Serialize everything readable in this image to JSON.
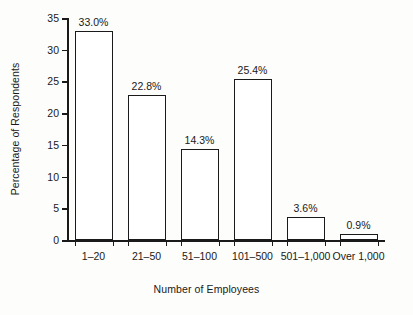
{
  "chart_data": {
    "type": "bar",
    "title": "",
    "xlabel": "Number of Employees",
    "ylabel": "Percentage of Respondents",
    "categories": [
      "1–20",
      "21–50",
      "51–100",
      "101–500",
      "501–1,000",
      "Over 1,000"
    ],
    "values": [
      33.0,
      22.8,
      14.3,
      25.4,
      3.6,
      0.9
    ],
    "value_labels": [
      "33.0%",
      "22.8%",
      "14.3%",
      "25.4%",
      "3.6%",
      "0.9%"
    ],
    "ylim": [
      0,
      35
    ],
    "ytick_values": [
      0,
      5,
      10,
      15,
      20,
      25,
      30,
      35
    ],
    "ytick_labels": [
      "0",
      "5",
      "10",
      "15",
      "20",
      "25",
      "30",
      "35"
    ],
    "grid": false,
    "legend": null,
    "bar_fill_color": "#ffffff",
    "bar_edge_color": "#1a1a1a",
    "axis_color": "#1a1a1a",
    "background_color": "#fdfdfb"
  }
}
